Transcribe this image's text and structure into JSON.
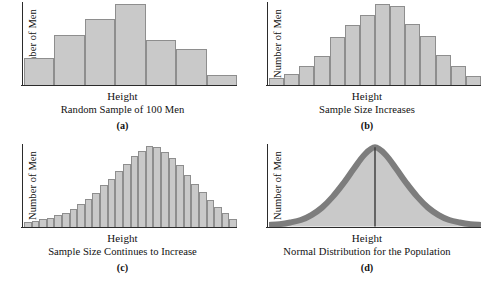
{
  "figure": {
    "shared_y_label": "Number of Men",
    "shared_x_label": "Height",
    "bar_fill_color": "#c9c9c9",
    "bar_stroke_color": "#8e8e8e",
    "axis_color": "#2b2b2b"
  },
  "panels": [
    {
      "letter": "(a)",
      "caption": "Random Sample of 100 Men",
      "y_label": "Number of Men",
      "x_label": "Height"
    },
    {
      "letter": "(b)",
      "caption": "Sample Size Increases",
      "y_label": "Number of Men",
      "x_label": "Height"
    },
    {
      "letter": "(c)",
      "caption": "Sample Size Continues to Increase",
      "y_label": "Number of Men",
      "x_label": "Height"
    },
    {
      "letter": "(d)",
      "caption": "Normal Distribution for the Population",
      "y_label": "Number of Men",
      "x_label": "Height"
    }
  ],
  "chart_data": [
    {
      "type": "bar",
      "title": "Random Sample of 100 Men",
      "panel": "(a)",
      "xlabel": "Height",
      "ylabel": "Number of Men",
      "grid": false,
      "legend": "none",
      "ylim": [
        0,
        100
      ],
      "categories": [
        "1",
        "2",
        "3",
        "4",
        "5",
        "6",
        "7"
      ],
      "values": [
        32,
        60,
        80,
        97,
        54,
        43,
        12
      ]
    },
    {
      "type": "bar",
      "title": "Sample Size Increases",
      "panel": "(b)",
      "xlabel": "Height",
      "ylabel": "Number of Men",
      "grid": false,
      "legend": "none",
      "ylim": [
        0,
        100
      ],
      "categories": [
        "1",
        "2",
        "3",
        "4",
        "5",
        "6",
        "7",
        "8",
        "9",
        "10",
        "11",
        "12",
        "13",
        "14"
      ],
      "values": [
        8,
        13,
        22,
        35,
        58,
        72,
        84,
        97,
        95,
        73,
        59,
        36,
        22,
        10
      ]
    },
    {
      "type": "bar",
      "title": "Sample Size Continues to Increase",
      "panel": "(c)",
      "xlabel": "Height",
      "ylabel": "Number of Men",
      "grid": false,
      "legend": "none",
      "ylim": [
        0,
        100
      ],
      "categories": [
        "1",
        "2",
        "3",
        "4",
        "5",
        "6",
        "7",
        "8",
        "9",
        "10",
        "11",
        "12",
        "13",
        "14",
        "15",
        "16",
        "17",
        "18",
        "19",
        "20",
        "21",
        "22",
        "23",
        "24",
        "25",
        "26",
        "27",
        "28"
      ],
      "values": [
        5,
        7,
        9,
        11,
        14,
        17,
        21,
        27,
        33,
        41,
        50,
        58,
        67,
        76,
        85,
        92,
        98,
        96,
        90,
        83,
        74,
        62,
        52,
        42,
        32,
        24,
        16,
        9
      ]
    },
    {
      "type": "area",
      "title": "Normal Distribution for the Population",
      "panel": "(d)",
      "xlabel": "Height",
      "ylabel": "Number of Men",
      "grid": false,
      "legend": "none",
      "curve": "normal",
      "mean_line": true,
      "mean_x": 0.5,
      "ylim": [
        0,
        100
      ],
      "x": [
        0.0,
        0.05,
        0.1,
        0.15,
        0.2,
        0.25,
        0.3,
        0.35,
        0.4,
        0.45,
        0.5,
        0.55,
        0.6,
        0.65,
        0.7,
        0.75,
        0.8,
        0.85,
        0.9,
        0.95,
        1.0
      ],
      "y": [
        2,
        3,
        5,
        8,
        14,
        23,
        36,
        52,
        70,
        87,
        96,
        87,
        70,
        52,
        36,
        23,
        14,
        8,
        5,
        3,
        2
      ]
    }
  ]
}
